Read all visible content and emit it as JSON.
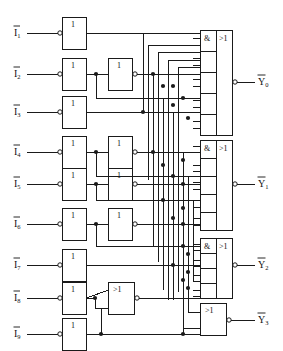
{
  "diagram": {
    "type": "logic-circuit",
    "width": 283,
    "height": 351,
    "line_color": "#1a1a1a",
    "background": "#ffffff"
  },
  "inputs": [
    {
      "id": "in1",
      "label": "I",
      "sub": "1",
      "overline": true,
      "y": 33
    },
    {
      "id": "in2",
      "label": "I",
      "sub": "2",
      "overline": true,
      "y": 74
    },
    {
      "id": "in3",
      "label": "I",
      "sub": "3",
      "overline": true,
      "y": 112
    },
    {
      "id": "in4",
      "label": "I",
      "sub": "4",
      "overline": true,
      "y": 152
    },
    {
      "id": "in5",
      "label": "I",
      "sub": "5",
      "overline": true,
      "y": 184
    },
    {
      "id": "in6",
      "label": "I",
      "sub": "6",
      "overline": true,
      "y": 224
    },
    {
      "id": "in7",
      "label": "I",
      "sub": "7",
      "overline": true,
      "y": 265
    },
    {
      "id": "in8",
      "label": "I",
      "sub": "8",
      "overline": true,
      "y": 298
    },
    {
      "id": "in9",
      "label": "I",
      "sub": "9",
      "overline": true,
      "y": 334
    }
  ],
  "outputs": [
    {
      "id": "out0",
      "label": "Y",
      "sub": "0",
      "overline": true,
      "y": 82,
      "bubble": true
    },
    {
      "id": "out1",
      "label": "Y",
      "sub": "1",
      "overline": true,
      "y": 184,
      "bubble": true
    },
    {
      "id": "out2",
      "label": "Y",
      "sub": "2",
      "overline": true,
      "y": 265,
      "bubble": true
    },
    {
      "id": "out3",
      "label": "Y",
      "sub": "3",
      "overline": true,
      "y": 320,
      "bubble": true
    }
  ],
  "gates": {
    "inverter_symbol": "1",
    "or_symbol": ">1",
    "and_symbol": "&",
    "column1_inverters": [
      {
        "id": "inv1",
        "symbol": "1",
        "x": 62,
        "y": 18,
        "w": 24,
        "h": 32,
        "bubble": "input"
      },
      {
        "id": "inv2",
        "symbol": "1",
        "x": 62,
        "y": 59,
        "w": 24,
        "h": 32,
        "bubble": "input"
      },
      {
        "id": "inv3",
        "symbol": "1",
        "x": 62,
        "y": 97,
        "w": 24,
        "h": 32,
        "bubble": "input"
      },
      {
        "id": "inv4",
        "symbol": "1",
        "x": 62,
        "y": 137,
        "w": 24,
        "h": 32,
        "bubble": "input"
      },
      {
        "id": "inv5",
        "symbol": "1",
        "x": 62,
        "y": 169,
        "w": 24,
        "h": 32,
        "bubble": "input"
      },
      {
        "id": "inv6",
        "symbol": "1",
        "x": 62,
        "y": 209,
        "w": 24,
        "h": 32,
        "bubble": "input"
      },
      {
        "id": "inv7",
        "symbol": "1",
        "x": 62,
        "y": 249,
        "w": 24,
        "h": 32,
        "bubble": "input"
      },
      {
        "id": "inv8",
        "symbol": "1",
        "x": 62,
        "y": 283,
        "w": 24,
        "h": 32,
        "bubble": "input"
      },
      {
        "id": "inv9",
        "symbol": "1",
        "x": 62,
        "y": 319,
        "w": 24,
        "h": 32,
        "bubble": "input"
      }
    ],
    "column2_gates": [
      {
        "id": "inv2b",
        "symbol": "1",
        "x": 108,
        "y": 59,
        "w": 24,
        "h": 32,
        "bubble": "output"
      },
      {
        "id": "inv4b",
        "symbol": "1",
        "x": 108,
        "y": 137,
        "w": 24,
        "h": 32,
        "bubble": "output"
      },
      {
        "id": "inv5b",
        "symbol": "1",
        "x": 108,
        "y": 169,
        "w": 24,
        "h": 32,
        "bubble": "output"
      },
      {
        "id": "inv6b",
        "symbol": "1",
        "x": 108,
        "y": 209,
        "w": 24,
        "h": 32,
        "bubble": "output"
      },
      {
        "id": "or89",
        "symbol": ">1",
        "x": 108,
        "y": 283,
        "w": 26,
        "h": 32,
        "bubble": "output"
      }
    ],
    "and_or_blocks": [
      {
        "id": "aoY0",
        "and_symbol": "&",
        "or_symbol": ">1",
        "x": 200,
        "y": 30,
        "w": 32,
        "h": 105,
        "and_w": 16,
        "sections": 5,
        "output_y": 82
      },
      {
        "id": "aoY1",
        "and_symbol": "&",
        "or_symbol": ">1",
        "x": 200,
        "y": 140,
        "w": 32,
        "h": 90,
        "and_w": 16,
        "sections": 5,
        "output_y": 184
      },
      {
        "id": "aoY2",
        "and_symbol": "&",
        "or_symbol": ">1",
        "x": 200,
        "y": 238,
        "w": 32,
        "h": 60,
        "and_w": 16,
        "sections": 4,
        "output_y": 265
      }
    ],
    "output_or": {
      "id": "orY3",
      "symbol": ">1",
      "x": 200,
      "y": 303,
      "w": 26,
      "h": 32,
      "bubble": "output"
    }
  },
  "legend": {
    "inverter_label": "1",
    "and_label": "&",
    "or_label": ">1"
  }
}
